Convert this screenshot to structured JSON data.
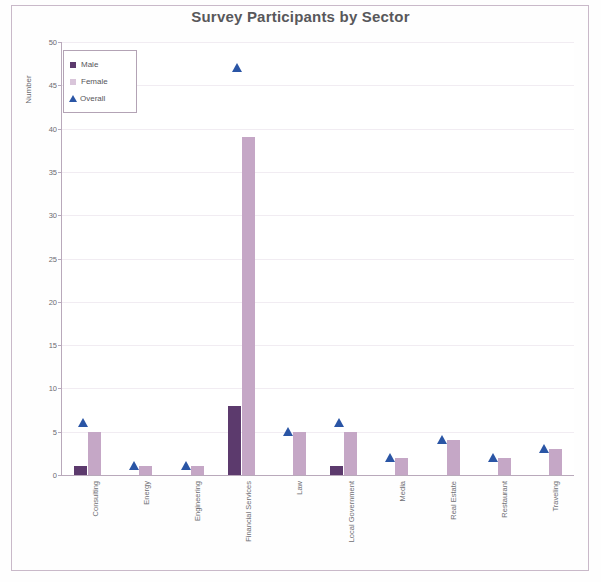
{
  "chart_data": {
    "type": "bar",
    "title": "Survey Participants by Sector",
    "xlabel": "",
    "ylabel": "Number",
    "ylim": [
      0,
      50
    ],
    "ytick_step": 5,
    "yticks": [
      0,
      5,
      10,
      15,
      20,
      25,
      30,
      35,
      40,
      45,
      50
    ],
    "grid": true,
    "legend_position": "top-left",
    "categories": [
      "Consulting",
      "Energy",
      "Engineering",
      "Financial Services",
      "Law",
      "Local Government",
      "Media",
      "Real Estate",
      "Restaurant",
      "Traveling"
    ],
    "series": [
      {
        "name": "Male",
        "type": "bar",
        "color": "#5c3a6d",
        "values": [
          1,
          0,
          0,
          8,
          0,
          1,
          0,
          0,
          0,
          0
        ]
      },
      {
        "name": "Female",
        "type": "bar",
        "color": "#c5a7c6",
        "values": [
          5,
          1,
          1,
          39,
          5,
          5,
          2,
          4,
          2,
          3
        ]
      },
      {
        "name": "Overall",
        "type": "scatter",
        "color": "#2a55a5",
        "marker": "triangle",
        "values": [
          6,
          1,
          1,
          47,
          5,
          6,
          2,
          4,
          2,
          3
        ]
      }
    ]
  },
  "legend": {
    "items": [
      {
        "label": "Male",
        "icon": "square-swatch-icon"
      },
      {
        "label": "Female",
        "icon": "square-swatch-icon"
      },
      {
        "label": "Overall",
        "icon": "triangle-marker-icon"
      }
    ]
  },
  "colors": {
    "male": "#5c3a6d",
    "female": "#c5a7c6",
    "overall": "#2a55a5",
    "title": "#58585b",
    "axis": "#b9a9bb",
    "grid": "#f1ecf2",
    "border": "#c9b9c9"
  }
}
